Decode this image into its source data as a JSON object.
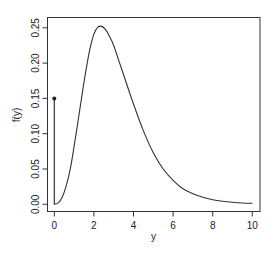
{
  "chart_data": {
    "type": "line",
    "title": "",
    "xlabel": "y",
    "ylabel": "f(y)",
    "xlim": [
      0,
      10
    ],
    "ylim": [
      0,
      0.25
    ],
    "x_ticks": [
      "0",
      "2",
      "4",
      "6",
      "8",
      "10"
    ],
    "y_ticks": [
      "0.00",
      "0.05",
      "0.10",
      "0.15",
      "0.20",
      "0.25"
    ],
    "grid": false,
    "legend": null,
    "point_mass": {
      "x": 0,
      "y": 0.15
    },
    "series": [
      {
        "name": "f(y) continuous part",
        "x": [
          0,
          0.2,
          0.4,
          0.6,
          0.8,
          1.0,
          1.2,
          1.4,
          1.6,
          1.8,
          2.0,
          2.2,
          2.4,
          2.6,
          2.8,
          3.0,
          3.3,
          3.6,
          4.0,
          4.5,
          5.0,
          5.5,
          6.0,
          6.5,
          7.0,
          7.5,
          8.0,
          8.5,
          9.0,
          9.5,
          10.0
        ],
        "values": [
          0.0,
          0.002,
          0.01,
          0.026,
          0.049,
          0.082,
          0.118,
          0.155,
          0.19,
          0.22,
          0.241,
          0.251,
          0.252,
          0.247,
          0.237,
          0.225,
          0.2,
          0.175,
          0.142,
          0.104,
          0.073,
          0.05,
          0.034,
          0.022,
          0.015,
          0.01,
          0.0065,
          0.0043,
          0.0029,
          0.0019,
          0.0013
        ]
      }
    ]
  }
}
